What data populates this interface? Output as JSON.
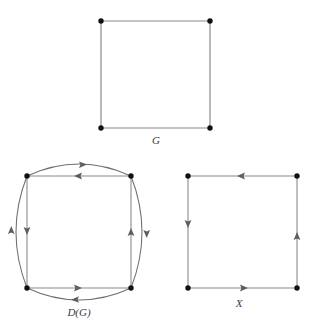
{
  "figure": {
    "caption_font_style": "italic-serif",
    "background_color": "#ffffff",
    "edge_color": "#8a8a8a",
    "arc_color": "#6f6f6f",
    "vertex_color": "#111111",
    "label_color": "#3a3a3a",
    "panels": [
      {
        "id": "panel-g",
        "label": "G",
        "type": "undirected-graph",
        "description": "4-cycle square with four undirected edges",
        "vertices": [
          {
            "name": "top-left",
            "x": 101,
            "y": 21
          },
          {
            "name": "top-right",
            "x": 210,
            "y": 21
          },
          {
            "name": "bottom-right",
            "x": 210,
            "y": 128
          },
          {
            "name": "bottom-left",
            "x": 101,
            "y": 128
          }
        ],
        "edges": [
          {
            "from": "top-left",
            "to": "top-right",
            "directed": false
          },
          {
            "from": "top-right",
            "to": "bottom-right",
            "directed": false
          },
          {
            "from": "bottom-right",
            "to": "bottom-left",
            "directed": false
          },
          {
            "from": "bottom-left",
            "to": "top-left",
            "directed": false
          }
        ],
        "label_position": {
          "x": 156,
          "y": 141
        }
      },
      {
        "id": "panel-dg",
        "label": "D(G)",
        "type": "directed-graph",
        "description": "Double of G: every undirected edge replaced by two opposite arcs, one straight chord and one outward-bulging curve",
        "vertices": [
          {
            "name": "top-left",
            "x": 27,
            "y": 176
          },
          {
            "name": "top-right",
            "x": 131,
            "y": 176
          },
          {
            "name": "bottom-right",
            "x": 131,
            "y": 288
          },
          {
            "name": "bottom-left",
            "x": 27,
            "y": 288
          }
        ],
        "straight_arcs": [
          {
            "from": "top-right",
            "to": "top-left",
            "arrow_direction": "left"
          },
          {
            "from": "top-left",
            "to": "bottom-left",
            "arrow_direction": "down"
          },
          {
            "from": "bottom-left",
            "to": "bottom-right",
            "arrow_direction": "right"
          },
          {
            "from": "bottom-right",
            "to": "top-right",
            "arrow_direction": "up"
          }
        ],
        "curved_arcs": [
          {
            "from": "top-left",
            "to": "top-right",
            "arrow_direction": "right",
            "bulge": "outward-top"
          },
          {
            "from": "top-right",
            "to": "bottom-right",
            "arrow_direction": "down",
            "bulge": "outward-right"
          },
          {
            "from": "bottom-right",
            "to": "bottom-left",
            "arrow_direction": "left",
            "bulge": "outward-bottom"
          },
          {
            "from": "bottom-left",
            "to": "top-left",
            "arrow_direction": "up",
            "bulge": "outward-left"
          }
        ],
        "label_position": {
          "x": 79,
          "y": 313
        }
      },
      {
        "id": "panel-x",
        "label": "X",
        "type": "directed-graph",
        "description": "Directed 4-cycle oriented counterclockwise",
        "vertices": [
          {
            "name": "top-left",
            "x": 188,
            "y": 176
          },
          {
            "name": "top-right",
            "x": 297,
            "y": 176
          },
          {
            "name": "bottom-right",
            "x": 297,
            "y": 288
          },
          {
            "name": "bottom-left",
            "x": 188,
            "y": 288
          }
        ],
        "straight_arcs": [
          {
            "from": "top-right",
            "to": "top-left",
            "arrow_direction": "left"
          },
          {
            "from": "top-left",
            "to": "bottom-left",
            "arrow_direction": "down"
          },
          {
            "from": "bottom-left",
            "to": "bottom-right",
            "arrow_direction": "right"
          },
          {
            "from": "bottom-right",
            "to": "top-right",
            "arrow_direction": "up"
          }
        ],
        "label_position": {
          "x": 239,
          "y": 304
        }
      }
    ]
  }
}
